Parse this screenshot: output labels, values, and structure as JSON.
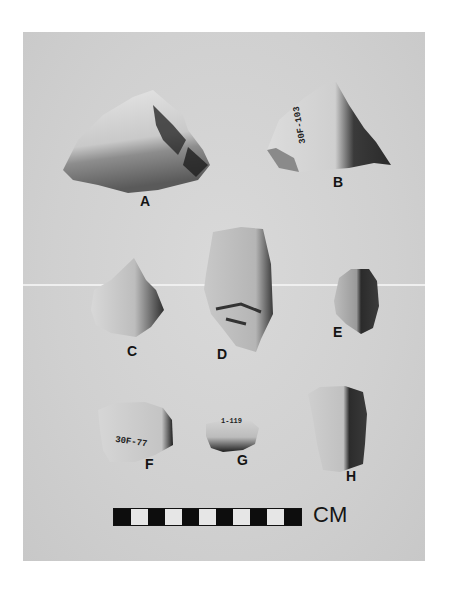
{
  "figure": {
    "background_color": "#d0d0d0",
    "artifacts": [
      {
        "id": "A",
        "label": "A"
      },
      {
        "id": "B",
        "label": "B",
        "catalog_number": "30F-103"
      },
      {
        "id": "C",
        "label": "C"
      },
      {
        "id": "D",
        "label": "D"
      },
      {
        "id": "E",
        "label": "E"
      },
      {
        "id": "F",
        "label": "F",
        "catalog_number": "30F-77"
      },
      {
        "id": "G",
        "label": "G",
        "catalog_number": "1-119"
      },
      {
        "id": "H",
        "label": "H"
      }
    ],
    "scale_bar": {
      "unit": "CM",
      "segments": 11,
      "pattern": [
        "black",
        "white",
        "black",
        "white",
        "black",
        "white",
        "black",
        "white",
        "black",
        "white",
        "black"
      ]
    }
  }
}
